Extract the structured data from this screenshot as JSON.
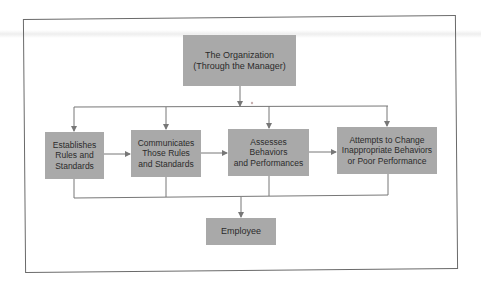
{
  "diagram": {
    "type": "flowchart",
    "colors": {
      "box_fill": "#a9a9a9",
      "text": "#2b2b2b",
      "line": "#777777",
      "frame": "#6a6a6a"
    },
    "top": {
      "label": "The Organization\n(Through the Manager)"
    },
    "steps": [
      {
        "label": "Establishes\nRules and\nStandards"
      },
      {
        "label": "Communicates\nThose Rules\nand Standards"
      },
      {
        "label": "Assesses\nBehaviors\nand Performances"
      },
      {
        "label": "Attempts to Change\nInappropriate Behaviors\nor Poor Performance"
      }
    ],
    "bottom": {
      "label": "Employee"
    },
    "edges": [
      {
        "from": "The Organization",
        "to": "Establishes Rules and Standards"
      },
      {
        "from": "The Organization",
        "to": "Communicates Those Rules and Standards"
      },
      {
        "from": "The Organization",
        "to": "Assesses Behaviors and Performances"
      },
      {
        "from": "The Organization",
        "to": "Attempts to Change Inappropriate Behaviors or Poor Performance"
      },
      {
        "from": "Establishes Rules and Standards",
        "to": "Communicates Those Rules and Standards"
      },
      {
        "from": "Communicates Those Rules and Standards",
        "to": "Assesses Behaviors and Performances"
      },
      {
        "from": "Assesses Behaviors and Performances",
        "to": "Attempts to Change Inappropriate Behaviors or Poor Performance"
      },
      {
        "from": "all steps",
        "to": "Employee"
      }
    ]
  }
}
